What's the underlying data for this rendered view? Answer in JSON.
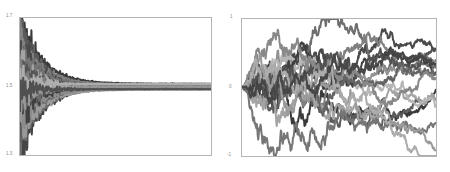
{
  "figure": {
    "background": "#ffffff",
    "frame_color": "#b4b4b4",
    "panel_count": 2
  },
  "chart_data": [
    {
      "id": "left",
      "type": "line",
      "title": "",
      "xlabel": "",
      "ylabel": "",
      "xlim": [
        0,
        1000
      ],
      "ylim": [
        1.3,
        1.7
      ],
      "grid": false,
      "legend": null,
      "y_ticks": [
        "1.7",
        "1.5",
        "1.3"
      ],
      "y_tick_values": [
        1.7,
        1.5,
        1.3
      ],
      "x_ticks": [],
      "description": "Many overlapping grayscale traces fan out from a wide vertical spread at x=0 and converge toward a narrow band near y=1.5.",
      "n_series": 18,
      "series": [
        {
          "name": "run-01",
          "color": "#3a3a3a",
          "start": 1.7,
          "end": 1.508
        },
        {
          "name": "run-02",
          "color": "#454545",
          "start": 1.3,
          "end": 1.497
        },
        {
          "name": "run-03",
          "color": "#5a5a5a",
          "start": 1.665,
          "end": 1.503
        },
        {
          "name": "run-04",
          "color": "#6e6e6e",
          "start": 1.335,
          "end": 1.494
        },
        {
          "name": "run-05",
          "color": "#828282",
          "start": 1.64,
          "end": 1.506
        },
        {
          "name": "run-06",
          "color": "#9a9a9a",
          "start": 1.36,
          "end": 1.491
        },
        {
          "name": "run-07",
          "color": "#4a4a4a",
          "start": 1.615,
          "end": 1.501
        },
        {
          "name": "run-08",
          "color": "#606060",
          "start": 1.385,
          "end": 1.496
        },
        {
          "name": "run-09",
          "color": "#747474",
          "start": 1.59,
          "end": 1.505
        },
        {
          "name": "run-10",
          "color": "#8c8c8c",
          "start": 1.41,
          "end": 1.493
        },
        {
          "name": "run-11",
          "color": "#a4a4a4",
          "start": 1.565,
          "end": 1.5
        },
        {
          "name": "run-12",
          "color": "#3f3f3f",
          "start": 1.435,
          "end": 1.498
        },
        {
          "name": "run-13",
          "color": "#555555",
          "start": 1.545,
          "end": 1.504
        },
        {
          "name": "run-14",
          "color": "#6a6a6a",
          "start": 1.455,
          "end": 1.495
        },
        {
          "name": "run-15",
          "color": "#7e7e7e",
          "start": 1.525,
          "end": 1.502
        },
        {
          "name": "run-16",
          "color": "#969696",
          "start": 1.475,
          "end": 1.499
        },
        {
          "name": "run-17",
          "color": "#aeaeae",
          "start": 1.51,
          "end": 1.507
        },
        {
          "name": "run-18",
          "color": "#505050",
          "start": 1.49,
          "end": 1.492
        }
      ]
    },
    {
      "id": "right",
      "type": "line",
      "title": "",
      "xlabel": "",
      "ylabel": "",
      "xlim": [
        0,
        1000
      ],
      "ylim": [
        -1,
        1
      ],
      "grid": false,
      "legend": null,
      "y_ticks": [
        "1",
        "0",
        "-1"
      ],
      "y_tick_values": [
        1,
        0,
        -1
      ],
      "x_ticks": [],
      "description": "Many grayscale random-walk traces all starting at 0 and spreading apart with increasing x, remaining mostly between -0.7 and 0.7.",
      "n_series": 16,
      "series": [
        {
          "name": "walk-01",
          "color": "#3a3a3a",
          "start": 0.0,
          "end": 0.33
        },
        {
          "name": "walk-02",
          "color": "#4a4a4a",
          "start": 0.0,
          "end": 0.21
        },
        {
          "name": "walk-03",
          "color": "#5c5c5c",
          "start": 0.0,
          "end": 0.12
        },
        {
          "name": "walk-04",
          "color": "#6e6e6e",
          "start": 0.0,
          "end": 0.05
        },
        {
          "name": "walk-05",
          "color": "#808080",
          "start": 0.0,
          "end": 0.25
        },
        {
          "name": "walk-06",
          "color": "#929292",
          "start": 0.0,
          "end": 0.17
        },
        {
          "name": "walk-07",
          "color": "#a4a4a4",
          "start": 0.0,
          "end": -0.42
        },
        {
          "name": "walk-08",
          "color": "#b6b6b6",
          "start": 0.0,
          "end": -0.55
        },
        {
          "name": "walk-09",
          "color": "#404040",
          "start": 0.0,
          "end": -0.31
        },
        {
          "name": "walk-10",
          "color": "#525252",
          "start": 0.0,
          "end": 0.28
        },
        {
          "name": "walk-11",
          "color": "#646464",
          "start": 0.0,
          "end": 0.08
        },
        {
          "name": "walk-12",
          "color": "#767676",
          "start": 0.0,
          "end": 0.02
        },
        {
          "name": "walk-13",
          "color": "#888888",
          "start": 0.0,
          "end": 0.19
        },
        {
          "name": "walk-14",
          "color": "#9a9a9a",
          "start": 0.0,
          "end": -0.48
        },
        {
          "name": "walk-15",
          "color": "#acacac",
          "start": 0.0,
          "end": -0.6
        },
        {
          "name": "walk-16",
          "color": "#464646",
          "start": 0.0,
          "end": 0.3
        }
      ]
    }
  ]
}
